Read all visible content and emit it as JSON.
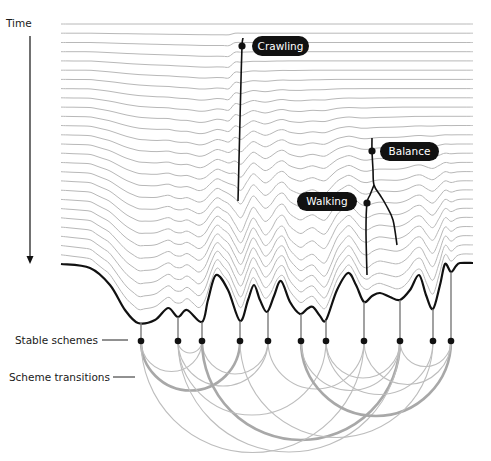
{
  "figure": {
    "axis": {
      "label": "Time",
      "arrow_x": 30,
      "arrow_y_start": 36,
      "arrow_y_end": 264
    },
    "colors": {
      "landscape_line": "#b8b8b8",
      "landscape_bold": "#111111",
      "trajectory": "#111111",
      "node": "#111111",
      "stem": "#7a7a7a",
      "arc_thin": "#bdbdbd",
      "arc_thick": "#a8a8a8",
      "pill_bg": "#111111",
      "pill_text": "#ffffff"
    },
    "landscape": {
      "x_start": 61,
      "x_end": 473,
      "top_y": 24,
      "line_count": 27,
      "bold_curve_points": [
        [
          61,
          264
        ],
        [
          90,
          268
        ],
        [
          110,
          285
        ],
        [
          125,
          310
        ],
        [
          138,
          323
        ],
        [
          155,
          320
        ],
        [
          168,
          308
        ],
        [
          178,
          317
        ],
        [
          187,
          310
        ],
        [
          202,
          322
        ],
        [
          208,
          300
        ],
        [
          216,
          275
        ],
        [
          228,
          290
        ],
        [
          240,
          321
        ],
        [
          248,
          300
        ],
        [
          254,
          285
        ],
        [
          260,
          300
        ],
        [
          267,
          312
        ],
        [
          274,
          296
        ],
        [
          281,
          281
        ],
        [
          290,
          302
        ],
        [
          300,
          314
        ],
        [
          307,
          309
        ],
        [
          313,
          307
        ],
        [
          320,
          316
        ],
        [
          326,
          320
        ],
        [
          337,
          290
        ],
        [
          348,
          273
        ],
        [
          356,
          285
        ],
        [
          364,
          302
        ],
        [
          372,
          296
        ],
        [
          380,
          293
        ],
        [
          390,
          297
        ],
        [
          400,
          300
        ],
        [
          410,
          290
        ],
        [
          419,
          275
        ],
        [
          426,
          295
        ],
        [
          433,
          309
        ],
        [
          440,
          285
        ],
        [
          445,
          264
        ],
        [
          451,
          272
        ],
        [
          456,
          266
        ],
        [
          460,
          263
        ],
        [
          473,
          263
        ]
      ]
    },
    "milestones": [
      {
        "label": "Crawling",
        "dot": [
          242,
          46
        ],
        "pill": {
          "x": 252,
          "y": 36,
          "w": 57,
          "h": 20
        }
      },
      {
        "label": "Balance",
        "dot": [
          372,
          151
        ],
        "pill": {
          "x": 380,
          "y": 142,
          "w": 59,
          "h": 19
        }
      },
      {
        "label": "Walking",
        "dot": [
          367,
          203
        ],
        "pill": {
          "x": 297,
          "y": 192,
          "w": 60,
          "h": 19
        }
      }
    ],
    "trajectories": [
      {
        "name": "crawling-path",
        "points": [
          [
            243,
            38
          ],
          [
            242,
            46
          ],
          [
            241,
            80
          ],
          [
            240,
            120
          ],
          [
            239,
            160
          ],
          [
            238,
            201
          ]
        ]
      },
      {
        "name": "balance-path",
        "points": [
          [
            372,
            138
          ],
          [
            372,
            151
          ],
          [
            373,
            170
          ],
          [
            374,
            185
          ],
          [
            380,
            195
          ],
          [
            386,
            205
          ],
          [
            393,
            220
          ],
          [
            397,
            245
          ]
        ]
      },
      {
        "name": "walking-path",
        "points": [
          [
            374,
            185
          ],
          [
            370,
            195
          ],
          [
            367,
            203
          ],
          [
            366,
            230
          ],
          [
            367,
            275
          ]
        ]
      }
    ],
    "legend": {
      "stable_schemes": {
        "label": "Stable schemes",
        "x": 98,
        "y": 344,
        "line": [
          102,
          128
        ]
      },
      "scheme_transitions": {
        "label": "Scheme transitions",
        "x": 110,
        "y": 381,
        "line": [
          113,
          135
        ]
      }
    },
    "nodes": {
      "y": 341,
      "items": [
        {
          "id": "A",
          "x": 141,
          "stem_top": 323
        },
        {
          "id": "B",
          "x": 178,
          "stem_top": 317
        },
        {
          "id": "C",
          "x": 202,
          "stem_top": 322
        },
        {
          "id": "D",
          "x": 240,
          "stem_top": 321
        },
        {
          "id": "E",
          "x": 268,
          "stem_top": 312
        },
        {
          "id": "F",
          "x": 301,
          "stem_top": 314
        },
        {
          "id": "G",
          "x": 326,
          "stem_top": 320
        },
        {
          "id": "H",
          "x": 364,
          "stem_top": 302
        },
        {
          "id": "I",
          "x": 400,
          "stem_top": 300
        },
        {
          "id": "J",
          "x": 433,
          "stem_top": 309
        },
        {
          "id": "K",
          "x": 451,
          "stem_top": 272
        }
      ]
    },
    "transitions": [
      {
        "from": "A",
        "to": "D",
        "weight": "thick"
      },
      {
        "from": "A",
        "to": "C",
        "weight": "thin"
      },
      {
        "from": "B",
        "to": "C",
        "weight": "thin"
      },
      {
        "from": "B",
        "to": "E",
        "weight": "thin"
      },
      {
        "from": "C",
        "to": "E",
        "weight": "thin"
      },
      {
        "from": "C",
        "to": "I",
        "weight": "thick"
      },
      {
        "from": "A",
        "to": "H",
        "weight": "thin"
      },
      {
        "from": "B",
        "to": "I",
        "weight": "thin"
      },
      {
        "from": "B",
        "to": "G",
        "weight": "thin"
      },
      {
        "from": "E",
        "to": "H",
        "weight": "thin"
      },
      {
        "from": "F",
        "to": "K",
        "weight": "thick"
      },
      {
        "from": "F",
        "to": "I",
        "weight": "thin"
      },
      {
        "from": "G",
        "to": "I",
        "weight": "thin"
      },
      {
        "from": "H",
        "to": "K",
        "weight": "thin"
      },
      {
        "from": "I",
        "to": "K",
        "weight": "thin"
      },
      {
        "from": "G",
        "to": "J",
        "weight": "thin"
      },
      {
        "from": "D",
        "to": "J",
        "weight": "thin"
      }
    ]
  }
}
